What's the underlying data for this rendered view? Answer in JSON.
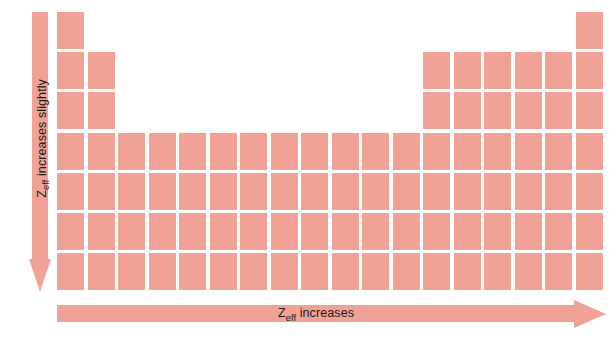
{
  "figure": {
    "type": "periodic-table-trend-diagram",
    "background_color": "#ffffff",
    "cell_color": "#f0a296",
    "text_color": "#1a1a1a"
  },
  "vertical_arrow": {
    "name": "z-eff-increases-slightly-arrow",
    "direction": "down",
    "label_full": "Zeff increases slightly",
    "label_symbol": "Z",
    "label_subscript": "eff",
    "label_rest": " increases slightly",
    "color": "#f0a296"
  },
  "horizontal_arrow": {
    "name": "z-eff-increases-arrow",
    "direction": "right",
    "label_full": "Zeff increases",
    "label_symbol": "Z",
    "label_subscript": "eff",
    "label_rest": " increases",
    "color": "#f0a296"
  },
  "periodic_table": {
    "columns": 18,
    "rows": 7,
    "cell_width": 27,
    "cell_height": 37,
    "col_pitch": 30.5,
    "row_pitch": 40.2,
    "row_occupancy": [
      [
        1,
        18
      ],
      [
        1,
        2,
        13,
        14,
        15,
        16,
        17,
        18
      ],
      [
        1,
        2,
        13,
        14,
        15,
        16,
        17,
        18
      ],
      [
        1,
        2,
        3,
        4,
        5,
        6,
        7,
        8,
        9,
        10,
        11,
        12,
        13,
        14,
        15,
        16,
        17,
        18
      ],
      [
        1,
        2,
        3,
        4,
        5,
        6,
        7,
        8,
        9,
        10,
        11,
        12,
        13,
        14,
        15,
        16,
        17,
        18
      ],
      [
        1,
        2,
        3,
        4,
        5,
        6,
        7,
        8,
        9,
        10,
        11,
        12,
        13,
        14,
        15,
        16,
        17,
        18
      ],
      [
        1,
        2,
        3,
        4,
        5,
        6,
        7,
        8,
        9,
        10,
        11,
        12,
        13,
        14,
        15,
        16,
        17,
        18
      ]
    ]
  }
}
